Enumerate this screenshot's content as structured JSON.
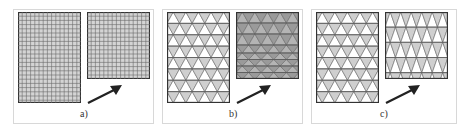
{
  "figure": {
    "panels": [
      {
        "id": "a",
        "label": "a)",
        "mesh_type": "quadrilateral",
        "description_left": "original quad mesh",
        "description_right": "compressed quad mesh",
        "fill_color": "#c9c9c9",
        "line_color": "#555555"
      },
      {
        "id": "b",
        "label": "b)",
        "mesh_type": "triangular",
        "description_left": "original triangle mesh",
        "description_right": "compressed triangle mesh with distorted lower rows",
        "fill_color": "#c8c8c8",
        "right_fill_color": "#a8a8a8",
        "line_color": "#555555"
      },
      {
        "id": "c",
        "label": "c)",
        "mesh_type": "triangular",
        "description_left": "original triangle mesh",
        "description_right": "remeshed triangle mesh",
        "fill_color": "#c8c8c8",
        "line_color": "#555555"
      }
    ],
    "arrow_icon": "arrow-up-right"
  }
}
